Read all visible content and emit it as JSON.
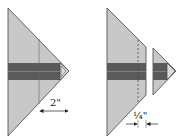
{
  "colors": {
    "fabric_light": "#c8c8c8",
    "band_dark": "#555555",
    "band_mid": "#7a7a7a",
    "outline": "#444444",
    "tip": "#dcdcdc"
  },
  "figures": [
    {
      "name": "before-trim",
      "measurement": {
        "label": "2\""
      }
    },
    {
      "name": "after-trim",
      "measurement": {
        "label": "¼\""
      }
    }
  ]
}
